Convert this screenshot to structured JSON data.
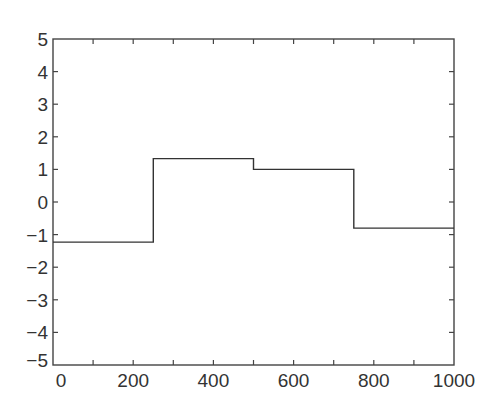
{
  "chart_data": {
    "type": "line",
    "title": "",
    "xlabel": "",
    "ylabel": "",
    "xlim": [
      0,
      1000
    ],
    "ylim": [
      -5,
      5
    ],
    "grid": false,
    "legend": null,
    "step": true,
    "xticks": [
      0,
      200,
      400,
      600,
      800,
      1000
    ],
    "xtick_labels": [
      "0",
      "200",
      "400",
      "600",
      "800",
      "1000"
    ],
    "yticks": [
      -5,
      -4,
      -3,
      -2,
      -1,
      0,
      1,
      2,
      3,
      4,
      5
    ],
    "ytick_labels": [
      "−5",
      "−4",
      "−3",
      "−2",
      "−1",
      "0",
      "1",
      "2",
      "3",
      "4",
      "5"
    ],
    "minor_xticks": [
      100,
      300,
      500,
      700,
      900
    ],
    "series": [
      {
        "name": "piecewise constant signal",
        "color": "#333333",
        "x": [
          0,
          250,
          250,
          500,
          500,
          750,
          750,
          1000
        ],
        "y": [
          -1.23,
          -1.23,
          1.33,
          1.33,
          1.0,
          1.0,
          -0.8,
          -0.8
        ]
      }
    ]
  }
}
